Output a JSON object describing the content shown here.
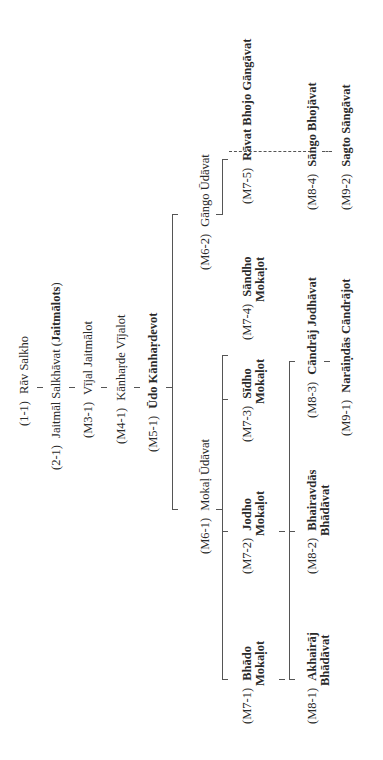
{
  "diagram": {
    "orientation": "rotated-90-ccw",
    "title": "",
    "nodes": [
      {
        "id": "1-1",
        "code": "(1-1)",
        "name": "Rāv Salkho",
        "bold": false
      },
      {
        "id": "2-1",
        "code": "(2-1)",
        "name": "Jaitmāl Salkhāvat (",
        "name_bold": "Jaitmālots",
        "name_after": ")",
        "bold": false
      },
      {
        "id": "M3-1",
        "code": "(M3-1)",
        "name": "Vījal Jaitmālot",
        "bold": false
      },
      {
        "id": "M4-1",
        "code": "(M4-1)",
        "name": "Kānhaṛde Vījalot",
        "bold": false
      },
      {
        "id": "M5-1",
        "code": "(M5-1)",
        "name": "Ūdo Kānhaṛdevot",
        "bold": true
      },
      {
        "id": "M6-1",
        "code": "(M6-1)",
        "name": "Mokaḷ Ūdāvat",
        "bold": false
      },
      {
        "id": "M6-2",
        "code": "(M6-2)",
        "name": "Gāngo Ūdāvat",
        "bold": false
      },
      {
        "id": "M7-1",
        "code": "(M7-1)",
        "name": "Bhādo",
        "name2": "Mokaḷot",
        "bold": true
      },
      {
        "id": "M7-2",
        "code": "(M7-2)",
        "name": "Jodho",
        "name2": "Mokaḷot",
        "bold": true
      },
      {
        "id": "M7-3",
        "code": "(M7-3)",
        "name": "Sīdho",
        "name2": "Mokaḷot",
        "bold": true
      },
      {
        "id": "M7-4",
        "code": "(M7-4)",
        "name": "Sāndho",
        "name2": "Mokaḷot",
        "bold": true
      },
      {
        "id": "M7-5",
        "code": "(M7-5)",
        "name": "Rāvat Bhojo Gāngāvat",
        "bold": true
      },
      {
        "id": "M8-1",
        "code": "(M8-1)",
        "name": "Akhairāj",
        "name2": "Bhādāvat",
        "bold": true
      },
      {
        "id": "M8-2",
        "code": "(M8-2)",
        "name": "Bhairavdās",
        "name2": "Bhādāvat",
        "bold": true
      },
      {
        "id": "M8-3",
        "code": "(M8-3)",
        "name": "Cāndrāj Jodhāvat",
        "bold": true
      },
      {
        "id": "M8-4",
        "code": "(M8-4)",
        "name": "Sāngo Bhojāvat",
        "bold": true
      },
      {
        "id": "M9-1",
        "code": "(M9-1)",
        "name": "Narāiṇdās Cāndrājot",
        "bold": true
      },
      {
        "id": "M9-2",
        "code": "(M9-2)",
        "name": "Sagto Sāngāvat",
        "bold": true
      }
    ],
    "edges": [
      [
        "1-1",
        "2-1"
      ],
      [
        "2-1",
        "M3-1"
      ],
      [
        "M3-1",
        "M4-1"
      ],
      [
        "M4-1",
        "M5-1"
      ],
      [
        "M5-1",
        "M6-1"
      ],
      [
        "M5-1",
        "M6-2"
      ],
      [
        "M6-1",
        "M7-1"
      ],
      [
        "M6-1",
        "M7-2"
      ],
      [
        "M6-1",
        "M7-3"
      ],
      [
        "M6-1",
        "M7-4"
      ],
      [
        "M6-2",
        "M7-5"
      ],
      [
        "M7-1",
        "M8-1"
      ],
      [
        "M7-1",
        "M8-2"
      ],
      [
        "M7-2",
        "M8-3"
      ],
      [
        "M7-5",
        "M8-4"
      ],
      [
        "M8-3",
        "M9-1"
      ],
      [
        "M8-4",
        "M9-2"
      ]
    ],
    "line_color": "#555555",
    "text_color": "#2a2a2a"
  }
}
